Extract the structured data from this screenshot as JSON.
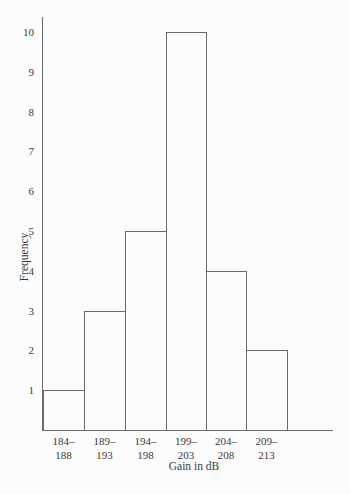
{
  "chart_data": {
    "type": "bar",
    "subtype": "histogram",
    "title": "",
    "xlabel": "Gain in dB",
    "ylabel": "Frequency",
    "categories": [
      "184–188",
      "189–193",
      "194–198",
      "199–203",
      "204–208",
      "209–213"
    ],
    "category_labels": [
      [
        "184–",
        "188"
      ],
      [
        "189–",
        "193"
      ],
      [
        "194–",
        "198"
      ],
      [
        "199–",
        "203"
      ],
      [
        "204–",
        "208"
      ],
      [
        "209–",
        "213"
      ]
    ],
    "values": [
      1,
      3,
      5,
      10,
      4,
      2
    ],
    "ylim": [
      0,
      10
    ],
    "yticks": [
      1,
      2,
      3,
      4,
      5,
      6,
      7,
      8,
      9,
      10
    ],
    "grid": false,
    "legend": false,
    "colors": {
      "background": "#fcfcfc",
      "line": "#6b6b6b",
      "text": "#3a3a3a",
      "bar_fill": "#fcfcfc"
    }
  }
}
